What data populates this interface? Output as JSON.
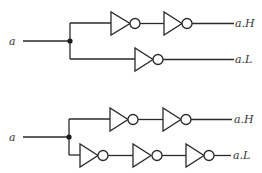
{
  "diagram": {
    "type": "logic-circuit",
    "circuits": [
      {
        "name": "circuit-top",
        "input_label": "a",
        "outputs": [
          {
            "label": "a.H",
            "inverters": 2
          },
          {
            "label": "a.L",
            "inverters": 1
          }
        ]
      },
      {
        "name": "circuit-bottom",
        "input_label": "a",
        "outputs": [
          {
            "label": "a.H",
            "inverters": 2
          },
          {
            "label": "a.L",
            "inverters": 3
          }
        ]
      }
    ],
    "colors": {
      "line": "#2a2a2a",
      "background": "#ffffff"
    }
  }
}
